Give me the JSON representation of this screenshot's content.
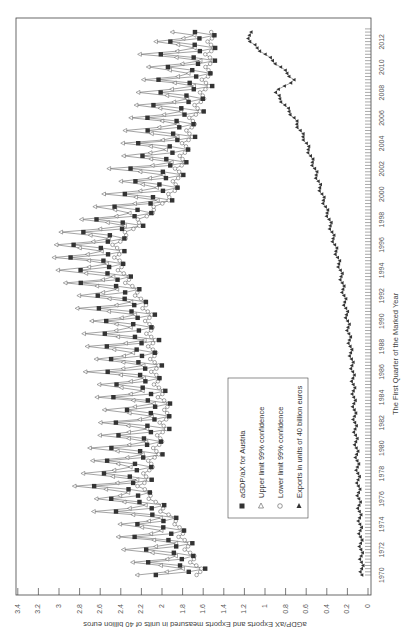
{
  "chart_data": {
    "type": "line",
    "orientation": "rotated-90-ccw",
    "title": "",
    "xlabel": "The First Quarter of the Marked Year",
    "ylabel": "aGDP/aX Exports and Exports measured in units of 40 billion euros",
    "xlim": [
      1970,
      2013
    ],
    "ylim": [
      0,
      3.4
    ],
    "x_ticks": [
      1970,
      1972,
      1974,
      1976,
      1978,
      1980,
      1982,
      1984,
      1986,
      1988,
      1990,
      1992,
      1994,
      1996,
      1998,
      2000,
      2002,
      2004,
      2006,
      2008,
      2010,
      2012
    ],
    "y_ticks": [
      0,
      0.2,
      0.4,
      0.6,
      0.8,
      1,
      1.2,
      1.4,
      1.6,
      1.8,
      2,
      2.2,
      2.4,
      2.6,
      2.8,
      3,
      3.2,
      3.4
    ],
    "y_tick_labels": [
      "0",
      "0.2",
      "0.4",
      "0.6",
      "0.8",
      "1",
      "1.2",
      "1.4",
      "1.6",
      "1.8",
      "2",
      "2.2",
      "2.4",
      "2.6",
      "2.8",
      "3",
      "3.2",
      "3.4"
    ],
    "grid": false,
    "legend_position": "inside-center",
    "frequency": "quarterly",
    "series": [
      {
        "name": "aGDP/aX for Austria",
        "marker": "filled-square",
        "color": "#333333",
        "anchor_years": [
          1970,
          1972,
          1974,
          1976,
          1977,
          1980,
          1983,
          1985,
          1988,
          1991,
          1994,
          1996,
          1998,
          2000,
          2003,
          2006,
          2008,
          2010,
          2012
        ],
        "anchor_levels": [
          1.78,
          1.9,
          2.0,
          2.25,
          2.35,
          2.2,
          2.1,
          2.2,
          2.25,
          2.3,
          2.55,
          2.6,
          2.35,
          2.05,
          1.95,
          1.85,
          1.75,
          1.7,
          1.68
        ],
        "seasonal_amplitude": 0.28
      },
      {
        "name": "Upper limit 99% confidence",
        "marker": "open-triangle",
        "color": "#555555",
        "offset_from_main": 0.18
      },
      {
        "name": "Lower limit 99% confidence",
        "marker": "open-circle",
        "color": "#555555",
        "offset_from_main": -0.18
      },
      {
        "name": "Exports in units of 40 billion euros",
        "marker": "filled-triangle",
        "color": "#333333",
        "anchor_years": [
          1970,
          1974,
          1978,
          1982,
          1986,
          1990,
          1994,
          1998,
          2000,
          2002,
          2004,
          2006,
          2008,
          2009,
          2010,
          2012
        ],
        "anchor_levels": [
          0.06,
          0.08,
          0.1,
          0.13,
          0.15,
          0.2,
          0.27,
          0.38,
          0.45,
          0.52,
          0.6,
          0.72,
          0.9,
          0.72,
          0.85,
          1.15
        ]
      }
    ]
  },
  "legend": {
    "items": [
      {
        "label": "aGDP/aX for Austria",
        "marker": "filled-square"
      },
      {
        "label": "Upper limit 99% confidence",
        "marker": "open-triangle"
      },
      {
        "label": "Lower limit 99% confidence",
        "marker": "open-circle"
      },
      {
        "label": "Exports in units of 40 billion euros",
        "marker": "filled-triangle"
      }
    ]
  },
  "axes": {
    "x_title": "The First Quarter of the Marked Year",
    "y_title": "aGDP/aX Exports and Exports measured in units of 40 billion euros"
  }
}
